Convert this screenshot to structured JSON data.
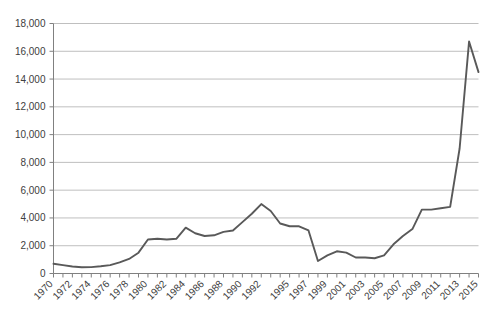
{
  "chart_data": {
    "type": "line",
    "title": "",
    "subtitle": "",
    "xlabel": "",
    "ylabel": "",
    "grid": true,
    "legend": false,
    "legend_position": "none",
    "line_color": "#595959",
    "axis_color": "#808080",
    "grid_color": "#bfbfbf",
    "text_color": "#404040",
    "background": "#ffffff",
    "ylim": [
      0,
      18000
    ],
    "yticks": [
      0,
      2000,
      4000,
      6000,
      8000,
      10000,
      12000,
      14000,
      16000,
      18000
    ],
    "ytick_labels": [
      "0",
      "2,000",
      "4,000",
      "6,000",
      "8,000",
      "10,000",
      "12,000",
      "14,000",
      "16,000",
      "18,000"
    ],
    "xlim": [
      1970,
      2015
    ],
    "x": [
      1970,
      1971,
      1972,
      1973,
      1974,
      1975,
      1976,
      1977,
      1978,
      1979,
      1980,
      1981,
      1982,
      1983,
      1984,
      1985,
      1986,
      1987,
      1988,
      1989,
      1990,
      1991,
      1992,
      1993,
      1994,
      1995,
      1996,
      1997,
      1998,
      1999,
      2000,
      2001,
      2002,
      2003,
      2004,
      2005,
      2006,
      2007,
      2008,
      2009,
      2010,
      2011,
      2012,
      2013,
      2014,
      2015
    ],
    "xtick_labels": [
      "1970",
      "",
      "1972",
      "",
      "1974",
      "",
      "1976",
      "",
      "1978",
      "",
      "1980",
      "",
      "1982",
      "",
      "1984",
      "",
      "1986",
      "",
      "1988",
      "",
      "1990",
      "",
      "1992",
      "",
      "",
      "1995",
      "",
      "1997",
      "",
      "1999",
      "",
      "2001",
      "",
      "2003",
      "",
      "2005",
      "",
      "2007",
      "",
      "2009",
      "",
      "2011",
      "",
      "2013",
      "",
      "2015"
    ],
    "values": [
      700,
      600,
      500,
      450,
      460,
      520,
      600,
      800,
      1050,
      1500,
      2450,
      2500,
      2450,
      2500,
      3300,
      2900,
      2700,
      2750,
      3000,
      3100,
      3700,
      4300,
      5000,
      4500,
      3600,
      3400,
      3400,
      3100,
      900,
      1300,
      1600,
      1500,
      1150,
      1150,
      1100,
      1300,
      2100,
      2700,
      3200,
      4600,
      4600,
      4700,
      4800,
      9000,
      16700,
      14500
    ]
  }
}
